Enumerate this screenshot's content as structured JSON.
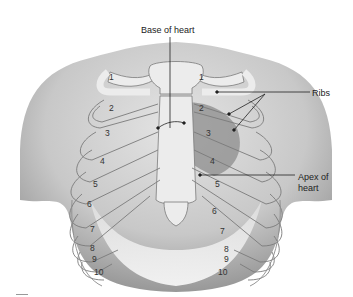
{
  "diagram": {
    "labels": {
      "base_of_heart": "Base of heart",
      "ribs": "Ribs",
      "apex_line1": "Apex of",
      "apex_line2": "heart"
    },
    "rib_numbers_left": [
      "1",
      "2",
      "3",
      "4",
      "5",
      "6",
      "7",
      "8",
      "9",
      "10"
    ],
    "rib_numbers_right": [
      "1",
      "2",
      "3",
      "4",
      "5",
      "6",
      "7",
      "8",
      "9",
      "10"
    ],
    "colors": {
      "skin": "#cfcfcf",
      "skin_dark": "#9a9a9a",
      "bone": "#ececec",
      "bone_outline": "#7a7a7a",
      "heart": "#8c8c8c",
      "leader_line": "#222222",
      "text": "#222222"
    }
  }
}
